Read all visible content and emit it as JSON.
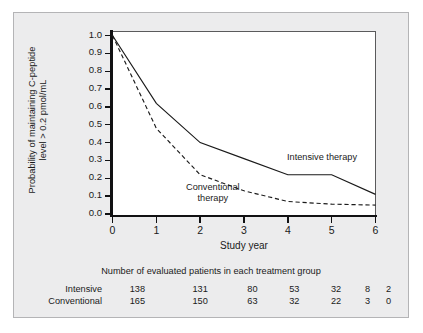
{
  "chart_data": {
    "type": "line",
    "title": "",
    "xlabel": "Study year",
    "ylabel_line1": "Probability of maintaining C-peptide",
    "ylabel_line2": "level > 0.2 pmol/mL",
    "x": [
      0,
      1,
      2,
      3,
      4,
      5,
      6
    ],
    "xticklabels": [
      "0",
      "1",
      "2",
      "3",
      "4",
      "5",
      "6"
    ],
    "yticklabels": [
      "1.0",
      "0.9",
      "0.8",
      "0.7",
      "0.6",
      "0.5",
      "0.4",
      "0.3",
      "0.2",
      "0.1",
      "0.0"
    ],
    "ytickvalues": [
      1.0,
      0.9,
      0.8,
      0.7,
      0.6,
      0.5,
      0.4,
      0.3,
      0.2,
      0.1,
      0.0
    ],
    "xlim": [
      0,
      6
    ],
    "ylim": [
      0.0,
      1.0
    ],
    "grid": false,
    "legend_position": "inline-annotations",
    "series": [
      {
        "name": "Intensive therapy",
        "style": "solid",
        "color": "#1a1a1a",
        "values": [
          1.0,
          0.62,
          0.4,
          0.31,
          0.22,
          0.22,
          0.11
        ]
      },
      {
        "name": "Conventional therapy",
        "style": "dashed",
        "color": "#1a1a1a",
        "values": [
          1.0,
          0.48,
          0.22,
          0.13,
          0.07,
          0.055,
          0.05
        ]
      }
    ],
    "annotations": [
      {
        "text": "Intensive therapy",
        "x": 4.0,
        "y": 0.3
      },
      {
        "text_line1": "Conventional",
        "text_line2": "therapy",
        "x": 2.1,
        "y": 0.13
      }
    ]
  },
  "risk_table": {
    "title": "Number of evaluated patients in each treatment group",
    "rows": [
      {
        "label": "Intensive",
        "values": [
          "138",
          "131",
          "80",
          "53",
          "32",
          "8",
          "2"
        ]
      },
      {
        "label": "Conventional",
        "values": [
          "165",
          "150",
          "63",
          "32",
          "22",
          "3",
          "0"
        ]
      }
    ]
  },
  "colors": {
    "panel_background": "#ececed",
    "panel_border": "#b4b4b6",
    "plot_background": "#ffffff",
    "axis": "#111113",
    "text": "#1a1a1a"
  }
}
